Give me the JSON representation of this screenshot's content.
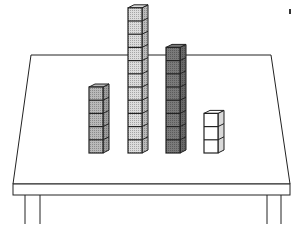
{
  "scene": {
    "description": "Four stacks of unit cubes on a table",
    "background": "#ffffff",
    "line_color": "#222222"
  },
  "table": {
    "top_back": {
      "y": 55,
      "x1": 31,
      "x2": 271
    },
    "top_front": {
      "y": 184,
      "x1": 13,
      "x2": 290
    },
    "apron_bottom": 195,
    "legs": [
      {
        "x1": 25,
        "x2": 40
      },
      {
        "x1": 267,
        "x2": 281
      }
    ],
    "leg_bottom": 224
  },
  "stacks": [
    {
      "name": "stack-1",
      "cubes": 5,
      "x": 89,
      "shade": "#b9b9b9",
      "pattern": "dots"
    },
    {
      "name": "stack-2",
      "cubes": 11,
      "x": 128,
      "shade": "#dcdcdc",
      "pattern": "dots"
    },
    {
      "name": "stack-3",
      "cubes": 8,
      "x": 166,
      "shade": "#7a7a7a",
      "pattern": "dots"
    },
    {
      "name": "stack-4",
      "cubes": 3,
      "x": 204,
      "shade": "#ffffff",
      "pattern": "none"
    }
  ],
  "cube": {
    "size": 13.2,
    "depth": 6,
    "base_y": 153
  },
  "mark": {
    "x": 290,
    "y": 12
  }
}
